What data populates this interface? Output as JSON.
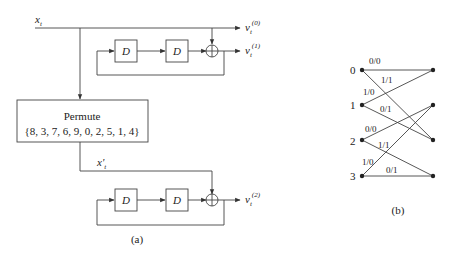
{
  "figure_a": {
    "caption": "(a)",
    "input_label": "x",
    "input_sub": "t",
    "interleaved_label": "x'",
    "interleaved_sub": "t",
    "delay_label": "D",
    "permute_title": "Permute",
    "permute_sequence": "{8, 3, 7, 6, 9, 0, 2, 5, 1, 4}",
    "outputs": [
      {
        "label": "v",
        "sub": "t",
        "sup": "(0)"
      },
      {
        "label": "v",
        "sub": "t",
        "sup": "(1)"
      },
      {
        "label": "v",
        "sub": "t",
        "sup": "(2)"
      }
    ]
  },
  "figure_b": {
    "caption": "(b)",
    "states": [
      "0",
      "1",
      "2",
      "3"
    ],
    "edges": [
      {
        "from": 0,
        "to": 0,
        "label": "0/0"
      },
      {
        "from": 0,
        "to": 2,
        "label": "1/1"
      },
      {
        "from": 1,
        "to": 0,
        "label": "1/0"
      },
      {
        "from": 1,
        "to": 2,
        "label": "0/1"
      },
      {
        "from": 2,
        "to": 1,
        "label": "0/0"
      },
      {
        "from": 2,
        "to": 3,
        "label": "1/1"
      },
      {
        "from": 3,
        "to": 1,
        "label": "1/0"
      },
      {
        "from": 3,
        "to": 3,
        "label": "0/1"
      }
    ]
  }
}
